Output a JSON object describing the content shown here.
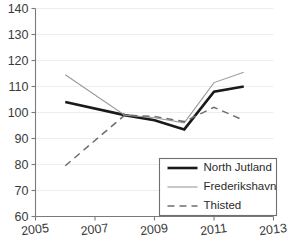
{
  "chart_data": {
    "type": "line",
    "title": "",
    "xlabel": "",
    "ylabel": "",
    "xlim": [
      2005,
      2013
    ],
    "ylim": [
      60,
      140
    ],
    "ytick_values": [
      60,
      70,
      80,
      90,
      100,
      110,
      120,
      130,
      140
    ],
    "ytick_labels": [
      "60",
      "70",
      "80",
      "90",
      "100",
      "110",
      "120",
      "130",
      "140"
    ],
    "xtick_values": [
      2005,
      2007,
      2009,
      2011,
      2013
    ],
    "xtick_labels": [
      "2005",
      "2007",
      "2009",
      "2011",
      "2013"
    ],
    "grid": true,
    "legend_position": "lower right",
    "x": [
      2006,
      2008,
      2009,
      2010,
      2011,
      2012
    ],
    "series": [
      {
        "name": "North Jutland",
        "values": [
          104,
          99,
          97,
          93.5,
          108,
          110
        ],
        "color": "#1a1a1a",
        "width": 2.6,
        "dash": "none"
      },
      {
        "name": "Frederikshavn",
        "values": [
          114.5,
          99,
          98,
          96,
          111.5,
          115.5
        ],
        "color": "#9a9a9a",
        "width": 1.1,
        "dash": "none"
      },
      {
        "name": "Thisted",
        "values": [
          79.5,
          99,
          98.5,
          96.5,
          102,
          97
        ],
        "color": "#6d6d6d",
        "width": 1.5,
        "dash": "7,5"
      }
    ]
  },
  "legend": {
    "entries": [
      {
        "label": "North Jutland"
      },
      {
        "label": "Frederikshavn"
      },
      {
        "label": "Thisted"
      }
    ]
  }
}
